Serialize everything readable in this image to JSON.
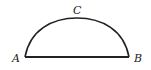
{
  "diagram": {
    "type": "circular-arc-segment",
    "labels": {
      "A": "A",
      "B": "B",
      "C": "C"
    },
    "colors": {
      "stroke": "#222222",
      "background": "#ffffff"
    }
  }
}
